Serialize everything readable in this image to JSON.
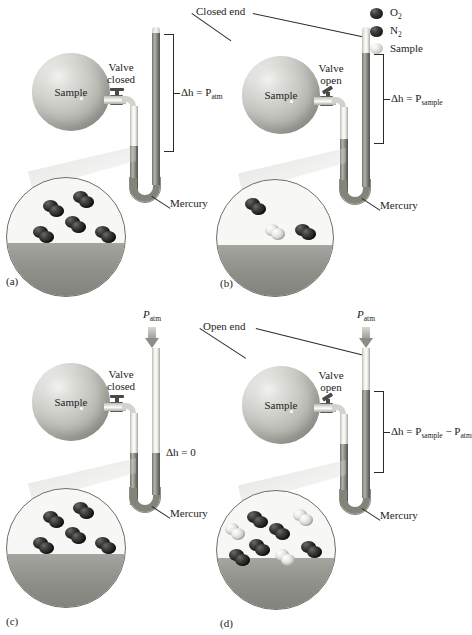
{
  "figure": {
    "type": "manometer-diagram",
    "panels": [
      "a",
      "b",
      "c",
      "d"
    ]
  },
  "legend": {
    "items": [
      {
        "label": "O",
        "sub": "2",
        "swatch": "dark",
        "name": "oxygen"
      },
      {
        "label": "N",
        "sub": "2",
        "swatch": "dark",
        "name": "nitrogen"
      },
      {
        "label": "Sample",
        "sub": "",
        "swatch": "light",
        "name": "sample"
      }
    ]
  },
  "shared_labels": {
    "closed_end": "Closed end",
    "open_end": "Open end",
    "mercury": "Mercury",
    "sample": "Sample",
    "p_atm": "P",
    "p_atm_sub": "atm"
  },
  "panels": [
    {
      "id": "a",
      "id_label": "(a)",
      "valve_line1": "Valve",
      "valve_line2": "closed",
      "bulb_label": "Sample",
      "mercury_label": "Mercury",
      "end_type": "Closed end",
      "equation": "Δh = P",
      "equation_sub": "atm",
      "equation_full": "Δh = P_atm",
      "inset_molecules": [
        {
          "type": "dark",
          "x": 44,
          "y": 22
        },
        {
          "type": "dark",
          "x": 71,
          "y": 13
        },
        {
          "type": "dark",
          "x": 33,
          "y": 47
        },
        {
          "type": "dark",
          "x": 66,
          "y": 37
        },
        {
          "type": "dark",
          "x": 95,
          "y": 47
        }
      ],
      "inset_dark_count": 5,
      "inset_light_count": 0
    },
    {
      "id": "b",
      "id_label": "(b)",
      "valve_line1": "Valve",
      "valve_line2": "open",
      "bulb_label": "Sample",
      "mercury_label": "Mercury",
      "end_type": "Closed end",
      "equation": "Δh = P",
      "equation_sub": "sample",
      "equation_full": "Δh = P_sample",
      "inset_molecules": [
        {
          "type": "dark",
          "x": 36,
          "y": 18
        },
        {
          "type": "light",
          "x": 56,
          "y": 44
        },
        {
          "type": "dark",
          "x": 86,
          "y": 44
        }
      ],
      "inset_dark_count": 2,
      "inset_light_count": 1
    },
    {
      "id": "c",
      "id_label": "(c)",
      "valve_line1": "Valve",
      "valve_line2": "closed",
      "bulb_label": "Sample",
      "mercury_label": "Mercury",
      "end_type": "Open end",
      "equation": "Δh = 0",
      "equation_sub": "",
      "equation_full": "Δh = 0",
      "p_atm_arrow": true,
      "inset_molecules": [
        {
          "type": "dark",
          "x": 44,
          "y": 22
        },
        {
          "type": "dark",
          "x": 72,
          "y": 13
        },
        {
          "type": "dark",
          "x": 33,
          "y": 47
        },
        {
          "type": "dark",
          "x": 66,
          "y": 37
        },
        {
          "type": "dark",
          "x": 96,
          "y": 47
        }
      ],
      "inset_dark_count": 5,
      "inset_light_count": 0
    },
    {
      "id": "d",
      "id_label": "(d)",
      "valve_line1": "Valve",
      "valve_line2": "open",
      "bulb_label": "Sample",
      "mercury_label": "Mercury",
      "end_type": "Open end",
      "equation": "Δh = P",
      "equation_sub": "sample",
      "equation_sub2": "atm",
      "equation_op": " − P",
      "equation_full": "Δh = P_sample − P_atm",
      "p_atm_arrow": true,
      "inset_molecules": [
        {
          "type": "light",
          "x": 14,
          "y": 32
        },
        {
          "type": "dark",
          "x": 36,
          "y": 20
        },
        {
          "type": "dark",
          "x": 58,
          "y": 32
        },
        {
          "type": "light",
          "x": 82,
          "y": 18
        },
        {
          "type": "dark",
          "x": 38,
          "y": 48
        },
        {
          "type": "dark",
          "x": 18,
          "y": 58
        },
        {
          "type": "light",
          "x": 64,
          "y": 58
        },
        {
          "type": "dark",
          "x": 90,
          "y": 50
        }
      ],
      "inset_dark_count": 5,
      "inset_light_count": 3
    }
  ],
  "colors": {
    "mercury_dark": "#7d7d76",
    "glass_light": "#e8e8e4",
    "molecule_dark": "#1d1d1c",
    "molecule_light": "#e5e5e1",
    "line": "#2b2b2b",
    "background": "#ffffff"
  }
}
